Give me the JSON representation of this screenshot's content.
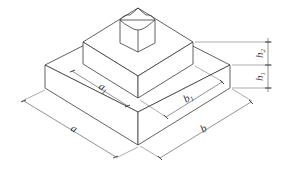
{
  "diagram": {
    "type": "isometric stepped foundation",
    "labels": {
      "a": "a",
      "a1_base": "a",
      "a1_sub": "1",
      "b": "b",
      "b1_base": "b",
      "b1_sub": "1",
      "h1_base": "h",
      "h1_sub": "1",
      "h2_base": "h",
      "h2_sub": "2"
    },
    "colors": {
      "line": "#3a3a3a",
      "background": "#ffffff"
    }
  }
}
